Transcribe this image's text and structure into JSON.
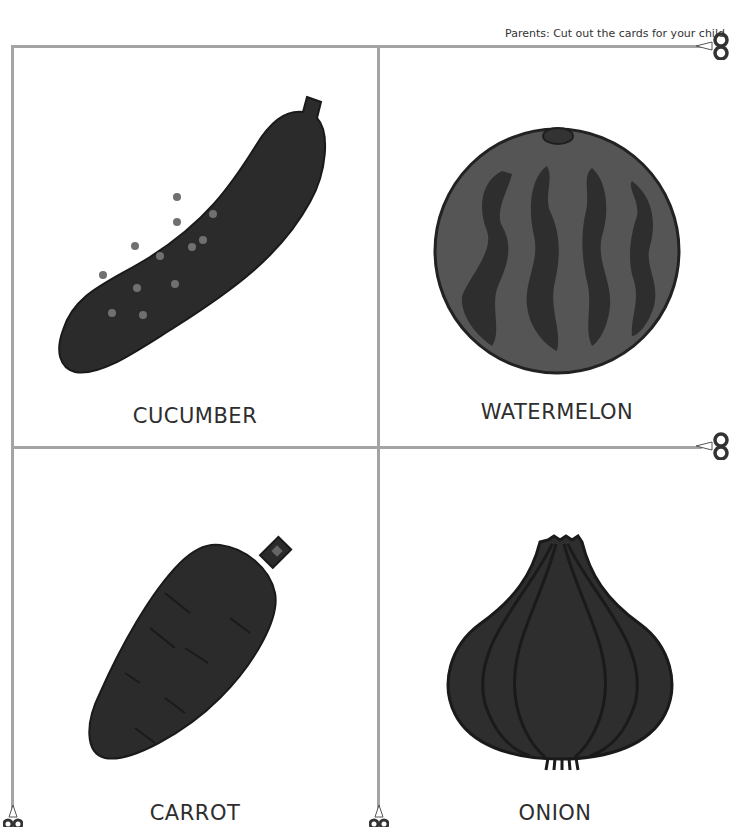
{
  "header": {
    "instruction": "Parents: Cut out the cards for your child."
  },
  "cards": [
    {
      "label": "CUCUMBER",
      "icon": "cucumber-icon"
    },
    {
      "label": "WATERMELON",
      "icon": "watermelon-icon"
    },
    {
      "label": "CARROT",
      "icon": "carrot-icon"
    },
    {
      "label": "ONION",
      "icon": "onion-icon"
    }
  ],
  "colors": {
    "cut_line": "#a4a4a4",
    "fill_dark": "#2b2b2b",
    "fill_mid": "#555555",
    "dots": "#707070"
  }
}
